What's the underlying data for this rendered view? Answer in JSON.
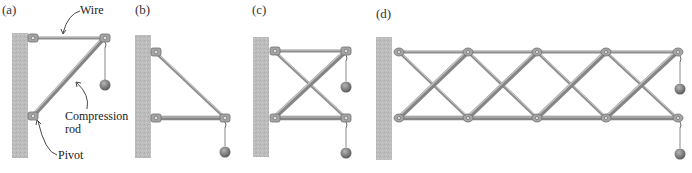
{
  "figure": {
    "panels": [
      {
        "id": "a",
        "label": "(a)",
        "description": "Wire and compression rod supporting a hanging weight"
      },
      {
        "id": "b",
        "label": "(b)",
        "description": "Diagonal member and horizontal rod supporting a weight"
      },
      {
        "id": "c",
        "label": "(c)",
        "description": "Two-bay X-braced frame with two hanging weights"
      },
      {
        "id": "d",
        "label": "(d)",
        "description": "Long truss with repeated X-bracing and two hanging weights"
      }
    ],
    "annotations": {
      "wire": "Wire",
      "compression_rod_line1": "Compression",
      "compression_rod_line2": "rod",
      "pivot": "Pivot"
    },
    "colors": {
      "wall": "#b9b9b9",
      "rod": "#8e8e8e",
      "rod_highlight": "#c8c8c8",
      "weight": "#7a7a7a",
      "text": "#222222"
    }
  }
}
